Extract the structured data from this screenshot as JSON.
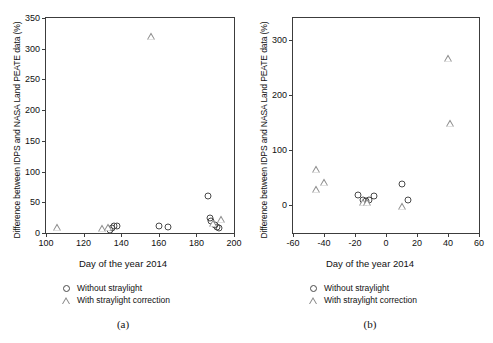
{
  "figure": {
    "width": 493,
    "height": 343,
    "background": "#ffffff",
    "marker_color_circle": "#4a4a4a",
    "marker_color_triangle": "#8a8a8a"
  },
  "legend": {
    "without_label": "Without straylight",
    "with_label": "With straylight correction",
    "circle_icon": "open-circle-marker",
    "triangle_icon": "open-triangle-marker"
  },
  "panels": [
    {
      "caption": "(a)"
    },
    {
      "caption": "(b)"
    }
  ],
  "chart_data": [
    {
      "type": "scatter",
      "panel": "(a)",
      "title": "",
      "xlabel": "Day of the year 2014",
      "ylabel": "Difference between IDPS and NASA Land PEATE data (%)",
      "xlim": [
        100,
        200
      ],
      "ylim": [
        0,
        350
      ],
      "xticks": [
        100,
        120,
        140,
        160,
        180,
        200
      ],
      "yticks": [
        0,
        50,
        100,
        150,
        200,
        250,
        300,
        350
      ],
      "grid": false,
      "legend_position": "below-plot-left",
      "series": [
        {
          "name": "Without straylight",
          "marker": "circle",
          "points": [
            [
              134,
              5
            ],
            [
              135,
              8
            ],
            [
              136,
              11
            ],
            [
              138,
              11
            ],
            [
              160,
              12
            ],
            [
              165,
              10
            ],
            [
              186,
              61
            ],
            [
              187,
              25
            ],
            [
              188,
              20
            ],
            [
              190,
              13
            ],
            [
              191,
              9
            ],
            [
              192,
              8
            ]
          ]
        },
        {
          "name": "With straylight correction",
          "marker": "triangle",
          "points": [
            [
              106,
              10
            ],
            [
              130,
              8
            ],
            [
              133,
              9
            ],
            [
              156,
              321
            ],
            [
              189,
              17
            ],
            [
              193,
              22
            ]
          ]
        }
      ]
    },
    {
      "type": "scatter",
      "panel": "(b)",
      "title": "",
      "xlabel": "Day of the year 2014",
      "ylabel": "Difference between IDPS and NASA Land  PEATE data (%)",
      "xlim": [
        -60,
        60
      ],
      "ylim": [
        -50,
        340
      ],
      "xticks": [
        -60,
        -40,
        -20,
        0,
        20,
        40,
        60
      ],
      "yticks": [
        0,
        100,
        200,
        300
      ],
      "grid": false,
      "legend_position": "below-plot-left",
      "series": [
        {
          "name": "Without straylight",
          "marker": "circle",
          "points": [
            [
              -18,
              19
            ],
            [
              -15,
              10
            ],
            [
              -13,
              8
            ],
            [
              -11,
              10
            ],
            [
              -8,
              18
            ],
            [
              10,
              38
            ],
            [
              14,
              9
            ]
          ]
        },
        {
          "name": "With straylight correction",
          "marker": "triangle",
          "points": [
            [
              -45,
              67
            ],
            [
              -45,
              30
            ],
            [
              -40,
              42
            ],
            [
              -15,
              6
            ],
            [
              -12,
              7
            ],
            [
              10,
              -1
            ],
            [
              40,
              268
            ],
            [
              41,
              150
            ]
          ]
        }
      ]
    }
  ]
}
